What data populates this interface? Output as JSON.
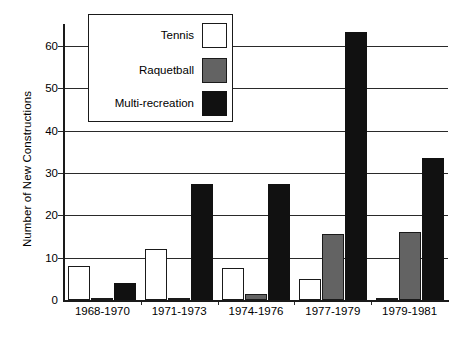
{
  "chart_data": {
    "type": "bar",
    "title": "",
    "xlabel": "",
    "ylabel": "Number of New Constructions",
    "categories": [
      "1968-1970",
      "1971-1973",
      "1974-1976",
      "1977-1979",
      "1979-1981"
    ],
    "series": [
      {
        "name": "Tennis",
        "color": "#ffffff",
        "values": [
          8,
          12,
          7.5,
          5,
          0.5
        ]
      },
      {
        "name": "Raquetball",
        "color": "#636363",
        "values": [
          0.5,
          0.5,
          1.5,
          15.5,
          16
        ]
      },
      {
        "name": "Multi-recreation",
        "color": "#111111",
        "values": [
          4,
          27.5,
          27.5,
          63.3,
          33.5
        ]
      }
    ],
    "ylim": [
      0,
      65
    ],
    "yticks": [
      0,
      10,
      20,
      30,
      40,
      50,
      60
    ],
    "ytick_labels": [
      "0",
      "10",
      "20",
      "30",
      "40",
      "50",
      "60"
    ],
    "grid": "horizontal",
    "legend_position": "top-left-inside",
    "legend_entries": [
      "Tennis",
      "Raquetball",
      "Multi-recreation"
    ]
  }
}
